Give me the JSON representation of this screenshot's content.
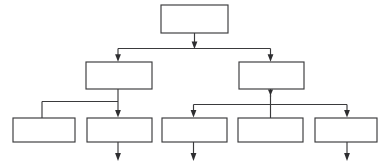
{
  "document": {
    "kind": "hierarchy-tree-diagram",
    "title": "",
    "background_color": "#ffffff",
    "line_color": "#3a3a3c",
    "fill_color": "#ffffff",
    "width": 386,
    "height": 167,
    "note": "Scanned blank organizational / tree chart: eight empty rectangles arranged in three tiers, joined by orthogonal arrow connectors."
  },
  "nodes": [
    {
      "id": "node-root",
      "label": "",
      "tier": 1,
      "x": 161,
      "y": 5,
      "w": 67,
      "h": 28
    },
    {
      "id": "node-l1-a",
      "label": "",
      "tier": 2,
      "x": 86,
      "y": 62,
      "w": 66,
      "h": 27
    },
    {
      "id": "node-l1-b",
      "label": "",
      "tier": 2,
      "x": 239,
      "y": 62,
      "w": 65,
      "h": 27
    },
    {
      "id": "node-l2-a",
      "label": "",
      "tier": 3,
      "x": 13,
      "y": 118,
      "w": 62,
      "h": 24
    },
    {
      "id": "node-l2-b",
      "label": "",
      "tier": 3,
      "x": 87,
      "y": 118,
      "w": 65,
      "h": 24
    },
    {
      "id": "node-l2-c",
      "label": "",
      "tier": 3,
      "x": 162,
      "y": 118,
      "w": 65,
      "h": 24
    },
    {
      "id": "node-l2-d",
      "label": "",
      "tier": 3,
      "x": 238,
      "y": 118,
      "w": 65,
      "h": 24
    },
    {
      "id": "node-l2-e",
      "label": "",
      "tier": 3,
      "x": 315,
      "y": 118,
      "w": 62,
      "h": 24
    }
  ],
  "connectors": [
    {
      "id": "conn-root-down",
      "from": "node-root",
      "to": "bus-1",
      "label": "",
      "arrowhead": true
    },
    {
      "id": "conn-bus1-left",
      "from": "bus-1",
      "to": "node-l1-a",
      "label": "",
      "arrowhead": true
    },
    {
      "id": "conn-bus1-right",
      "from": "bus-1",
      "to": "node-l1-b",
      "label": "",
      "arrowhead": true
    },
    {
      "id": "conn-l1a-down",
      "from": "node-l1-a",
      "to": "bus-2",
      "label": "",
      "arrowhead": false
    },
    {
      "id": "conn-bus2-left",
      "from": "bus-2",
      "to": "node-l2-a",
      "label": "",
      "arrowhead": false
    },
    {
      "id": "conn-bus2-center",
      "from": "bus-2",
      "to": "node-l2-b",
      "label": "",
      "arrowhead": true
    },
    {
      "id": "conn-l1b-down",
      "from": "node-l1-b",
      "to": "bus-3",
      "label": "",
      "arrowhead": true
    },
    {
      "id": "conn-bus3-left",
      "from": "bus-3",
      "to": "node-l2-c",
      "label": "",
      "arrowhead": true
    },
    {
      "id": "conn-bus3-center",
      "from": "bus-3",
      "to": "node-l2-d",
      "label": "",
      "arrowhead": false
    },
    {
      "id": "conn-bus3-right",
      "from": "bus-3",
      "to": "node-l2-e",
      "label": "",
      "arrowhead": true
    },
    {
      "id": "conn-l2b-exit",
      "from": "node-l2-b",
      "to": "",
      "label": "",
      "arrowhead": true
    },
    {
      "id": "conn-l2c-exit",
      "from": "node-l2-c",
      "to": "",
      "label": "",
      "arrowhead": true
    },
    {
      "id": "conn-l2e-exit",
      "from": "node-l2-e",
      "to": "",
      "label": "",
      "arrowhead": true
    }
  ]
}
